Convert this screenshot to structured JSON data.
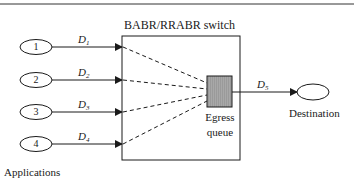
{
  "diagram": {
    "switch_title": "BABR/RRABR switch",
    "applications_label": "Applications",
    "destination_label": "Destination",
    "queue_label_line1": "Egress",
    "queue_label_line2": "queue",
    "sources": [
      {
        "id": "1",
        "flow": "D",
        "sub": "1"
      },
      {
        "id": "2",
        "flow": "D",
        "sub": "2"
      },
      {
        "id": "3",
        "flow": "D",
        "sub": "3"
      },
      {
        "id": "4",
        "flow": "D",
        "sub": "4"
      }
    ],
    "output_flow": {
      "flow": "D",
      "sub": "5"
    },
    "colors": {
      "line": "#1a1a1a",
      "queue_fill": "#a8a8a8",
      "background": "#ffffff"
    }
  }
}
